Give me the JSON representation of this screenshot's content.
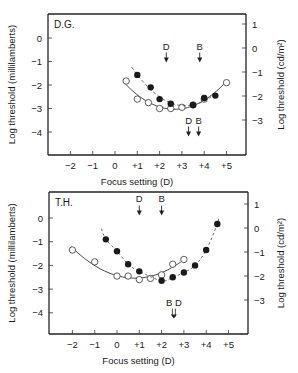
{
  "chart_data": [
    {
      "type": "scatter",
      "panel_label": "D.G.",
      "xlabel": "Focus setting (D)",
      "ylabel": "Log threshold (millilamberts)",
      "ylabel_right": "Log threshold (cd/m²)",
      "xlim": [
        -3,
        6
      ],
      "ylim": [
        -5,
        1
      ],
      "x_ticks": [
        "-2",
        "-1",
        "0",
        "+1",
        "+2",
        "+3",
        "+4",
        "+5"
      ],
      "y_ticks": [
        "0",
        "-1",
        "-2",
        "-3",
        "-4"
      ],
      "y_ticks_right": [
        "1",
        "0",
        "-1",
        "-2",
        "-3"
      ],
      "series": [
        {
          "name": "open circles (solid fit)",
          "marker": "open",
          "x": [
            0.5,
            1.0,
            1.5,
            2.0,
            2.5,
            3.0,
            3.5,
            4.0,
            5.0
          ],
          "y": [
            -1.83,
            -2.6,
            -2.75,
            -3.0,
            -3.0,
            -2.95,
            -2.85,
            -2.6,
            -1.9
          ]
        },
        {
          "name": "filled circles (dashed fit)",
          "marker": "filled",
          "x": [
            1.0,
            1.6,
            2.0,
            2.5,
            3.5,
            4.0,
            4.5
          ],
          "y": [
            -1.57,
            -2.1,
            -2.6,
            -2.8,
            -2.85,
            -2.55,
            -2.45
          ]
        }
      ],
      "annotations": [
        {
          "label": "D",
          "x": 2.3,
          "y": -1.0,
          "direction": "down"
        },
        {
          "label": "B",
          "x": 3.8,
          "y": -1.0,
          "direction": "down"
        },
        {
          "label": "D",
          "x": 3.3,
          "y": -4.15,
          "direction": "down"
        },
        {
          "label": "B",
          "x": 3.75,
          "y": -4.15,
          "direction": "down"
        }
      ]
    },
    {
      "type": "scatter",
      "panel_label": "T.H.",
      "xlabel": "Focus setting (D)",
      "ylabel": "Log threshold (millilamberts)",
      "ylabel_right": "Log threshold (cd/m²)",
      "xlim": [
        -3,
        6
      ],
      "ylim": [
        -5,
        1
      ],
      "x_ticks": [
        "-2",
        "-1",
        "0",
        "+1",
        "+2",
        "+3",
        "+4",
        "+5"
      ],
      "y_ticks": [
        "0",
        "-1",
        "-2",
        "-3",
        "-4"
      ],
      "y_ticks_right": [
        "1",
        "0",
        "-1",
        "-2",
        "-3"
      ],
      "series": [
        {
          "name": "open circles (solid fit)",
          "marker": "open",
          "x": [
            -2,
            -1,
            0,
            0.5,
            1.0,
            1.5,
            2.0,
            2.5,
            3.0
          ],
          "y": [
            -1.35,
            -1.85,
            -2.45,
            -2.45,
            -2.6,
            -2.55,
            -2.4,
            -1.95,
            -1.75
          ]
        },
        {
          "name": "filled circles (dashed fit)",
          "marker": "filled",
          "x": [
            -0.5,
            0,
            0.5,
            1.0,
            2.0,
            2.5,
            3.0,
            3.5,
            4.0,
            4.5
          ],
          "y": [
            -0.9,
            -1.4,
            -1.95,
            -2.25,
            -2.65,
            -2.5,
            -2.3,
            -2.0,
            -1.35,
            -0.25
          ]
        }
      ],
      "annotations": [
        {
          "label": "D",
          "x": 1.0,
          "y": 0.15,
          "direction": "down"
        },
        {
          "label": "B",
          "x": 2.0,
          "y": 0.15,
          "direction": "down"
        },
        {
          "label": "B D",
          "x": 2.55,
          "y": -4.2,
          "direction": "down"
        }
      ]
    }
  ]
}
